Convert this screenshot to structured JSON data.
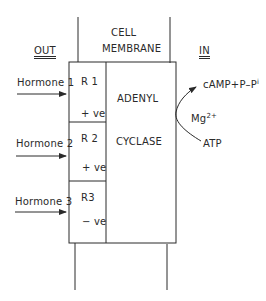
{
  "diagram": {
    "title_line1": "CELL",
    "title_line2": "MEMBRANE",
    "side_out": "OUT",
    "side_in": "IN",
    "hormones": [
      {
        "label": "Hormone 1"
      },
      {
        "label": "Hormone 2"
      },
      {
        "label": "Hormone 3"
      }
    ],
    "receptors": [
      {
        "name": "R 1",
        "effect": "+ ve"
      },
      {
        "name": "R 2",
        "effect": "+ ve"
      },
      {
        "name": "R3",
        "effect": "− ve"
      }
    ],
    "enzyme_line1": "ADENYL",
    "enzyme_line2": "CYCLASE",
    "product": "cAMP+P–P",
    "product_suffix": "i",
    "cofactor": "Mg",
    "cofactor_charge": "2+",
    "substrate": "ATP",
    "colors": {
      "line": "#2a2a2a",
      "background": "#ffffff"
    }
  }
}
